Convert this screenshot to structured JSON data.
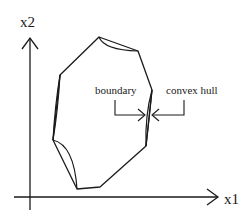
{
  "diagram": {
    "type": "convex hull vs boundary illustration",
    "axes": {
      "x_label": "x1",
      "y_label": "x2"
    },
    "annotations": {
      "boundary_label": "boundary",
      "convex_hull_label": "convex hull"
    },
    "colors": {
      "stroke": "#1a1a1a",
      "background": "#ffffff"
    }
  }
}
